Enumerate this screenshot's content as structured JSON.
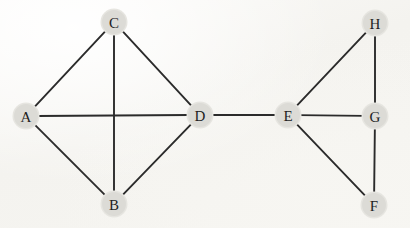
{
  "figure": {
    "width": 410,
    "height": 228,
    "background_color": "#f7f6f3",
    "edge_color": "#2b2b2b",
    "node_halo_color": "#dcdbd6",
    "label_color": "#1e1e1e"
  },
  "graph": {
    "type": "undirected",
    "node_count": 8,
    "edge_count": 12,
    "nodes": [
      {
        "id": "A",
        "label": "A",
        "x": 26,
        "y": 116,
        "r": 12
      },
      {
        "id": "B",
        "label": "B",
        "x": 114,
        "y": 204,
        "r": 12
      },
      {
        "id": "C",
        "label": "C",
        "x": 114,
        "y": 22,
        "r": 12
      },
      {
        "id": "D",
        "label": "D",
        "x": 200,
        "y": 115,
        "r": 12
      },
      {
        "id": "E",
        "label": "E",
        "x": 288,
        "y": 115,
        "r": 12
      },
      {
        "id": "F",
        "label": "F",
        "x": 374,
        "y": 205,
        "r": 12
      },
      {
        "id": "G",
        "label": "G",
        "x": 375,
        "y": 116,
        "r": 12
      },
      {
        "id": "H",
        "label": "H",
        "x": 375,
        "y": 23,
        "r": 12
      }
    ],
    "edges": [
      {
        "from": "A",
        "to": "C"
      },
      {
        "from": "A",
        "to": "D"
      },
      {
        "from": "A",
        "to": "B"
      },
      {
        "from": "C",
        "to": "D"
      },
      {
        "from": "C",
        "to": "B"
      },
      {
        "from": "B",
        "to": "D"
      },
      {
        "from": "D",
        "to": "E"
      },
      {
        "from": "E",
        "to": "H"
      },
      {
        "from": "E",
        "to": "G"
      },
      {
        "from": "E",
        "to": "F"
      },
      {
        "from": "H",
        "to": "G"
      },
      {
        "from": "G",
        "to": "F"
      }
    ]
  },
  "chart_data": {
    "type": "diagram",
    "vertices": [
      "A",
      "B",
      "C",
      "D",
      "E",
      "F",
      "G",
      "H"
    ],
    "edge_list": [
      [
        "A",
        "C"
      ],
      [
        "A",
        "D"
      ],
      [
        "A",
        "B"
      ],
      [
        "C",
        "D"
      ],
      [
        "C",
        "B"
      ],
      [
        "B",
        "D"
      ],
      [
        "D",
        "E"
      ],
      [
        "E",
        "H"
      ],
      [
        "E",
        "G"
      ],
      [
        "E",
        "F"
      ],
      [
        "H",
        "G"
      ],
      [
        "G",
        "F"
      ]
    ],
    "degrees": {
      "A": 3,
      "B": 3,
      "C": 3,
      "D": 4,
      "E": 4,
      "F": 2,
      "G": 3,
      "H": 2
    },
    "bridge_edges": [
      [
        "D",
        "E"
      ]
    ]
  }
}
